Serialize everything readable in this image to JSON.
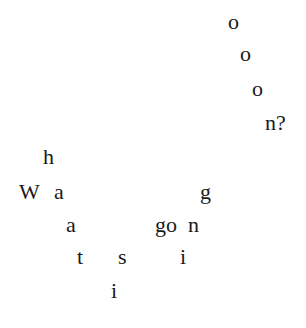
{
  "artwork": {
    "phrase": "What is going on?",
    "text_color": "#1a1a1a",
    "background_color": "#ffffff",
    "glyphs": [
      {
        "char": "o",
        "x": 228,
        "y": 11
      },
      {
        "char": "o",
        "x": 240,
        "y": 43
      },
      {
        "char": "o",
        "x": 252,
        "y": 78
      },
      {
        "char": "n?",
        "x": 265,
        "y": 112
      },
      {
        "char": "h",
        "x": 43,
        "y": 146
      },
      {
        "char": "W",
        "x": 19,
        "y": 181
      },
      {
        "char": "a",
        "x": 54,
        "y": 181
      },
      {
        "char": "g",
        "x": 200,
        "y": 181
      },
      {
        "char": "a",
        "x": 66,
        "y": 214
      },
      {
        "char": "go",
        "x": 155,
        "y": 214
      },
      {
        "char": "n",
        "x": 188,
        "y": 214
      },
      {
        "char": "t",
        "x": 77,
        "y": 246
      },
      {
        "char": "s",
        "x": 118,
        "y": 246
      },
      {
        "char": "i",
        "x": 180,
        "y": 246
      },
      {
        "char": "i",
        "x": 111,
        "y": 280
      }
    ]
  }
}
